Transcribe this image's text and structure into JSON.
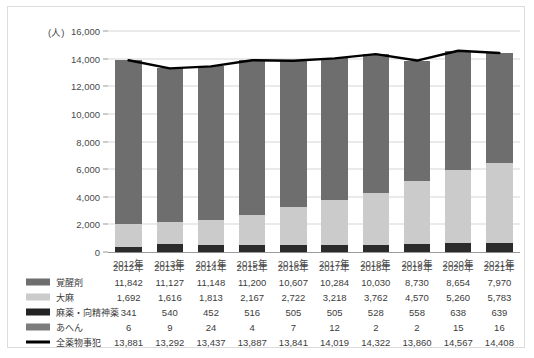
{
  "chart_data": {
    "type": "bar",
    "title": "",
    "subtitle": "",
    "xlabel": "",
    "ylabel": "(人)",
    "unit_label": "(人)",
    "ylim": [
      0,
      16000
    ],
    "ytick_step": 2000,
    "yticks": [
      "0",
      "2,000",
      "4,000",
      "6,000",
      "8,000",
      "10,000",
      "12,000",
      "14,000",
      "16,000"
    ],
    "ytick_values": [
      0,
      2000,
      4000,
      6000,
      8000,
      10000,
      12000,
      14000,
      16000
    ],
    "grid": true,
    "legend_position": "bottom-table",
    "stacked": true,
    "categories": [
      "2012年",
      "2013年",
      "2014年",
      "2015年",
      "2016年",
      "2017年",
      "2018年",
      "2019年",
      "2020年",
      "2021年"
    ],
    "series": [
      {
        "name": "覚醒剤",
        "kind": "bar",
        "color": "#6e6e6e",
        "values": [
          11842,
          11127,
          11148,
          11200,
          10607,
          10284,
          10030,
          8730,
          8654,
          7970
        ],
        "labels": [
          "11,842",
          "11,127",
          "11,148",
          "11,200",
          "10,607",
          "10,284",
          "10,030",
          "8,730",
          "8,654",
          "7,970"
        ]
      },
      {
        "name": "大麻",
        "kind": "bar",
        "color": "#cbcbcb",
        "values": [
          1692,
          1616,
          1813,
          2167,
          2722,
          3218,
          3762,
          4570,
          5260,
          5783
        ],
        "labels": [
          "1,692",
          "1,616",
          "1,813",
          "2,167",
          "2,722",
          "3,218",
          "3,762",
          "4,570",
          "5,260",
          "5,783"
        ]
      },
      {
        "name": "麻薬・向精神薬",
        "kind": "bar",
        "color": "#2b2b2b",
        "values": [
          341,
          540,
          452,
          516,
          505,
          505,
          528,
          558,
          638,
          639
        ],
        "labels": [
          "341",
          "540",
          "452",
          "516",
          "505",
          "505",
          "528",
          "558",
          "638",
          "639"
        ]
      },
      {
        "name": "あへん",
        "kind": "bar",
        "color": "#8a8a8a",
        "values": [
          6,
          9,
          24,
          4,
          7,
          12,
          2,
          2,
          15,
          16
        ],
        "labels": [
          "6",
          "9",
          "24",
          "4",
          "7",
          "12",
          "2",
          "2",
          "15",
          "16"
        ]
      },
      {
        "name": "全薬物事犯",
        "kind": "line",
        "color": "#000000",
        "values": [
          13881,
          13292,
          13437,
          13887,
          13841,
          14019,
          14322,
          13860,
          14567,
          14408
        ],
        "labels": [
          "13,881",
          "13,292",
          "13,437",
          "13,887",
          "13,841",
          "14,019",
          "14,322",
          "13,860",
          "14,567",
          "14,408"
        ]
      }
    ]
  },
  "table": {
    "corner": "",
    "headers": [
      "2012年",
      "2013年",
      "2014年",
      "2015年",
      "2016年",
      "2017年",
      "2018年",
      "2019年",
      "2020年",
      "2021年"
    ],
    "rows": [
      {
        "label": "覚醒剤",
        "swatch": "stim",
        "values": [
          "11,842",
          "11,127",
          "11,148",
          "11,200",
          "10,607",
          "10,284",
          "10,030",
          "8,730",
          "8,654",
          "7,970"
        ]
      },
      {
        "label": "大麻",
        "swatch": "cann",
        "values": [
          "1,692",
          "1,616",
          "1,813",
          "2,167",
          "2,722",
          "3,218",
          "3,762",
          "4,570",
          "5,260",
          "5,783"
        ]
      },
      {
        "label": "麻薬・向精神薬",
        "swatch": "narc",
        "values": [
          "341",
          "540",
          "452",
          "516",
          "505",
          "505",
          "528",
          "558",
          "638",
          "639"
        ]
      },
      {
        "label": "あへん",
        "swatch": "opi",
        "values": [
          "6",
          "9",
          "24",
          "4",
          "7",
          "12",
          "2",
          "2",
          "15",
          "16"
        ]
      },
      {
        "label": "全薬物事犯",
        "swatch": "total",
        "values": [
          "13,881",
          "13,292",
          "13,437",
          "13,887",
          "13,841",
          "14,019",
          "14,322",
          "13,860",
          "14,567",
          "14,408"
        ]
      }
    ]
  },
  "colors": {
    "stimulants": "#6e6e6e",
    "cannabis": "#cbcbcb",
    "narcotics": "#2b2b2b",
    "opium": "#8a8a8a",
    "total_line": "#000000",
    "grid": "#d6d6d6",
    "border": "#dcdcdc"
  }
}
